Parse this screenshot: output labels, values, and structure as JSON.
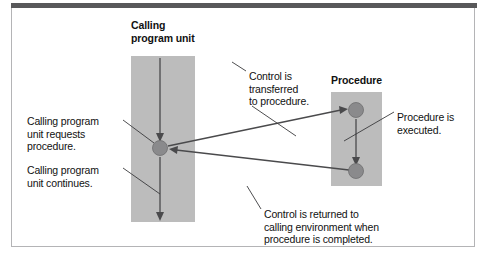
{
  "figure": {
    "type": "flow-diagram",
    "title_calling": "Calling\nprogram unit",
    "title_procedure": "Procedure"
  },
  "colors": {
    "block_fill": "#bcbcbc",
    "node_fill": "#8a8a8c",
    "line": "#4a4a4c",
    "frame_bar": "#58585a",
    "frame_border": "#b4b4b6",
    "background": "#ffffff",
    "text": "#111111"
  },
  "blocks": [
    {
      "id": "calling-program-unit",
      "heading": "Calling\nprogram unit"
    },
    {
      "id": "procedure",
      "heading": "Procedure"
    }
  ],
  "labels": {
    "requests": "Calling program\nunit requests\nprocedure.",
    "continues": "Calling program\nunit continues.",
    "control_transferred": "Control is\ntransferred\nto procedure.",
    "procedure_executed": "Procedure is\nexecuted.",
    "control_returned": "Control is returned to\ncalling environment when\nprocedure is completed."
  },
  "nodes": [
    {
      "id": "call-site-node",
      "x": 160,
      "y": 148,
      "r": 7.5
    },
    {
      "id": "procedure-entry-node",
      "x": 356,
      "y": 110,
      "r": 7.5
    },
    {
      "id": "procedure-exit-node",
      "x": 356,
      "y": 171,
      "r": 7.5
    }
  ],
  "flows": [
    {
      "id": "calling-flow-upper",
      "from": [
        160,
        58
      ],
      "to": [
        160,
        140
      ]
    },
    {
      "id": "calling-flow-lower",
      "from": [
        160,
        156
      ],
      "to": [
        160,
        220
      ]
    },
    {
      "id": "procedure-flow",
      "from": [
        356,
        118
      ],
      "to": [
        356,
        164
      ]
    },
    {
      "id": "transfer-flow",
      "from": [
        167,
        150
      ],
      "to": [
        347,
        110
      ]
    },
    {
      "id": "return-flow",
      "from": [
        348,
        171
      ],
      "to": [
        169,
        150
      ]
    }
  ]
}
